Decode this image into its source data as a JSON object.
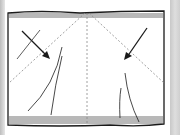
{
  "diagram": {
    "type": "fabric-folding-illustration",
    "colors": {
      "line": "#1a1a1a",
      "fold_line": "#888888",
      "background": "#ffffff",
      "side_strip": "#cfcfcf"
    },
    "elements": {
      "fabric": "rectangle with fringed top and bottom edges",
      "fold_lines": [
        "center vertical dashed",
        "left diagonal dashed",
        "right diagonal dashed"
      ],
      "arrows": [
        "left arrow pointing down-right",
        "right arrow pointing down-left"
      ],
      "crease_lines": 4
    }
  }
}
